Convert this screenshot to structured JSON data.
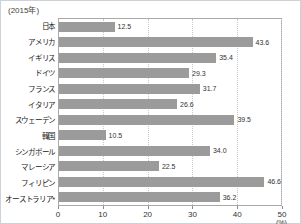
{
  "header": {
    "year_label": "(2015年)"
  },
  "chart_data": {
    "type": "bar",
    "orientation": "horizontal",
    "title": "",
    "xlabel": "(%)",
    "ylabel": "",
    "xlim": [
      0,
      50
    ],
    "x_ticks": [
      "0",
      "10",
      "20",
      "30",
      "40",
      "50"
    ],
    "grid": true,
    "bar_color": "#9b9b9b",
    "categories": [
      "日本",
      "アメリカ",
      "イギリス",
      "ドイツ",
      "フランス",
      "イタリア",
      "スウェーデン",
      "韓国",
      "シンガポール",
      "マレーシア",
      "フィリピン",
      "オーストラリア*"
    ],
    "values": [
      12.5,
      43.6,
      35.4,
      29.3,
      31.7,
      26.6,
      39.5,
      10.5,
      34.0,
      22.5,
      46.6,
      36.2
    ],
    "value_labels": [
      "12.5",
      "43.6",
      "35.4",
      "29.3",
      "31.7",
      "26.6",
      "39.5",
      "10.5",
      "34.0",
      "22.5",
      "46.6",
      "36.2"
    ],
    "unit_label": "(%)"
  }
}
